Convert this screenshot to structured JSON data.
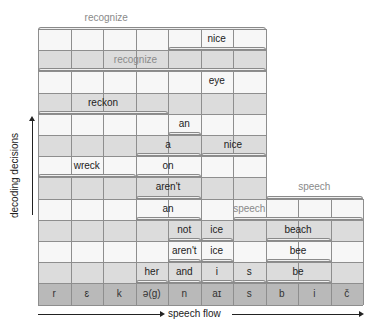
{
  "diagram": {
    "phonemes": [
      "r",
      "ɛ",
      "k",
      "ə(g)",
      "n",
      "aɪ",
      "s",
      "b",
      "i",
      "č"
    ],
    "top_label": {
      "text": "recognize",
      "faint": true,
      "start": 0,
      "end": 7
    },
    "rows": [
      {
        "shade": "white",
        "width_cols": 7,
        "words": [
          {
            "text": "nice",
            "start": 4,
            "end": 7,
            "bracket": true
          }
        ]
      },
      {
        "shade": "gray",
        "width_cols": 7,
        "words": [
          {
            "text": "recognize",
            "start": 0,
            "end": 7,
            "bracket": true,
            "faint": true
          }
        ]
      },
      {
        "shade": "white",
        "width_cols": 7,
        "words": [
          {
            "text": "eye",
            "start": 4,
            "end": 7,
            "bracket": false
          }
        ]
      },
      {
        "shade": "gray",
        "width_cols": 7,
        "words": [
          {
            "text": "reckon",
            "start": 0,
            "end": 4,
            "bracket": true
          }
        ]
      },
      {
        "shade": "white",
        "width_cols": 7,
        "words": [
          {
            "text": "an",
            "start": 4,
            "end": 5,
            "bracket": true
          }
        ]
      },
      {
        "shade": "gray",
        "width_cols": 7,
        "words": [
          {
            "text": "a",
            "start": 3,
            "end": 5,
            "bracket": true
          },
          {
            "text": "nice",
            "start": 5,
            "end": 7,
            "bracket": true
          }
        ]
      },
      {
        "shade": "white",
        "width_cols": 7,
        "words": [
          {
            "text": "wreck",
            "start": 0,
            "end": 3,
            "bracket": true
          },
          {
            "text": "on",
            "start": 3,
            "end": 5,
            "bracket": true
          }
        ]
      },
      {
        "shade": "gray",
        "width_cols": 7,
        "words": [
          {
            "text": "aren't",
            "start": 3,
            "end": 5,
            "bracket": true
          }
        ],
        "side_label": {
          "text": "speech",
          "faint": true,
          "start": 7,
          "end": 10
        }
      },
      {
        "shade": "white",
        "width_cols": 10,
        "words": [
          {
            "text": "an",
            "start": 3,
            "end": 5,
            "bracket": true
          },
          {
            "text": "speech",
            "start": 6,
            "end": 7,
            "bracket": true,
            "faint": true,
            "span_end": 10
          }
        ]
      },
      {
        "shade": "gray",
        "width_cols": 10,
        "words": [
          {
            "text": "not",
            "start": 4,
            "end": 5,
            "bracket": true
          },
          {
            "text": "ice",
            "start": 5,
            "end": 6,
            "bracket": true
          },
          {
            "text": "beach",
            "start": 7,
            "end": 9,
            "bracket": true
          }
        ]
      },
      {
        "shade": "white",
        "width_cols": 10,
        "words": [
          {
            "text": "aren't",
            "start": 4,
            "end": 5,
            "bracket": true
          },
          {
            "text": "ice",
            "start": 5,
            "end": 6,
            "bracket": true
          },
          {
            "text": "bee",
            "start": 7,
            "end": 9,
            "bracket": true
          }
        ]
      },
      {
        "shade": "gray",
        "width_cols": 10,
        "words": [
          {
            "text": "her",
            "start": 3,
            "end": 4,
            "bracket": true
          },
          {
            "text": "and",
            "start": 4,
            "end": 5,
            "bracket": true
          },
          {
            "text": "i",
            "start": 5,
            "end": 6,
            "bracket": true
          },
          {
            "text": "s",
            "start": 6,
            "end": 7,
            "bracket": true
          },
          {
            "text": "be",
            "start": 7,
            "end": 9,
            "bracket": true
          }
        ]
      }
    ],
    "y_axis_label": "decoding decisions",
    "x_axis_label": "speech flow"
  }
}
